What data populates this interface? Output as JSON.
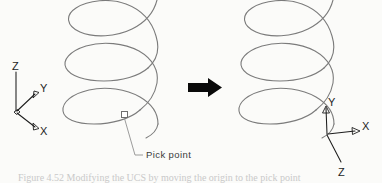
{
  "figure": {
    "background_color": "#fbfbf9",
    "curve_color": "#7b7b7b",
    "axis_color": "#1d1d1d",
    "arrow_color": "#0a0a0a"
  },
  "left_ucs": {
    "name": "world-ucs",
    "z_label": "Z",
    "y_label": "Y",
    "x_label": "X"
  },
  "right_ucs": {
    "name": "new-ucs",
    "y_label": "Y",
    "x_label": "X",
    "z_label": "Z"
  },
  "callout": {
    "label": "Pick point"
  },
  "transition": {
    "arrow_icon": "right-arrow-icon"
  },
  "left_helix": {
    "name": "helix-before",
    "turns": 3
  },
  "right_helix": {
    "name": "helix-after",
    "turns": 3
  },
  "caption": {
    "text": "Figure 4.52   Modifying the UCS by moving the origin to the pick point"
  }
}
